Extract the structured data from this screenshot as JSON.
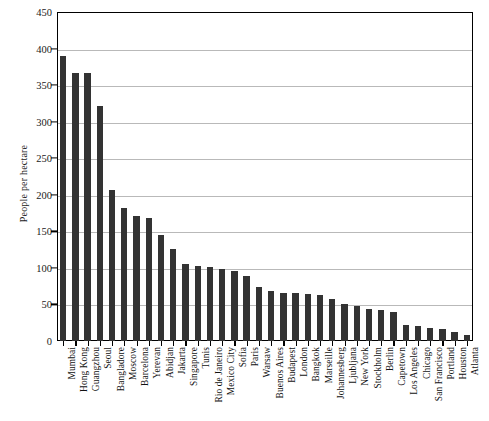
{
  "chart_data": {
    "type": "bar",
    "title": "",
    "subtitle": "",
    "xlabel": "",
    "ylabel": "People per hectare",
    "ylim": [
      0,
      450
    ],
    "ytick_step": 50,
    "yticks": [
      0,
      50,
      100,
      150,
      200,
      250,
      300,
      350,
      400,
      450
    ],
    "grid": true,
    "legend": null,
    "bar_color": "#333333",
    "background_color": "#ffffff",
    "axis_color": "#000000",
    "gridline_color": "#b9b9b9",
    "orientation": "vertical",
    "sorted": "descending",
    "categories": [
      "Mumbai",
      "Hong Kong",
      "Guangzhou",
      "Seoul",
      "Bangladore",
      "Moscow",
      "Barcelona",
      "Yerevan",
      "Abidjan",
      "Jakarta",
      "Singapore",
      "Tunis",
      "Rio de Janeiro",
      "Mexico City",
      "Sofia",
      "Paris",
      "Warsaw",
      "Buenos Aires",
      "Budapest",
      "London",
      "Bangkok",
      "Marseille",
      "Johannesberg",
      "Ljubljana",
      "New York",
      "Stockholm",
      "Berlin",
      "Capetown",
      "Los Angeles",
      "Chicago",
      "San Francisco",
      "Portland",
      "Houston",
      "Atlanta"
    ],
    "values": [
      390,
      367,
      366,
      322,
      206,
      182,
      171,
      168,
      145,
      126,
      105,
      103,
      101,
      99,
      96,
      89,
      74,
      68,
      66,
      65,
      64,
      63,
      58,
      50,
      48,
      44,
      42,
      40,
      22,
      20,
      18,
      17,
      12,
      8
    ]
  }
}
